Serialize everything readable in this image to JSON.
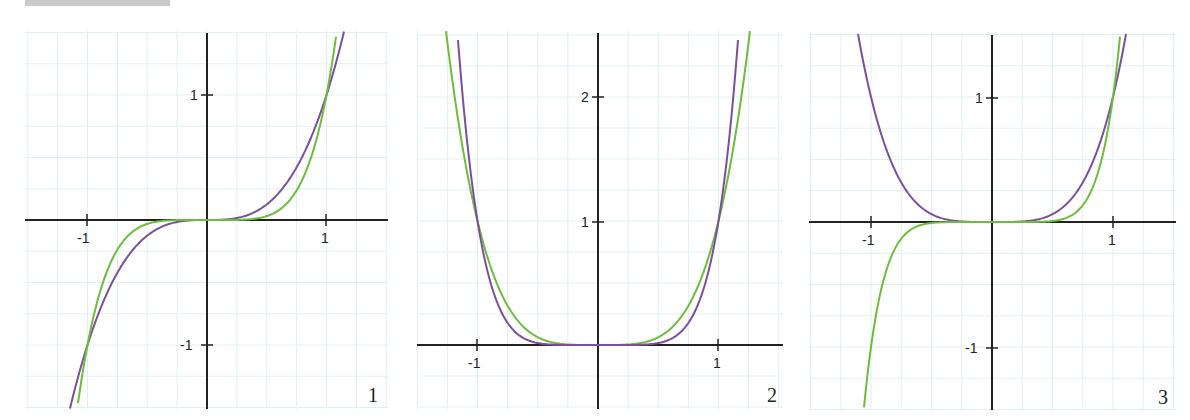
{
  "header": {
    "bar": "cropped-gray-strip"
  },
  "colors": {
    "purple": "#7b4f9e",
    "green": "#6cbd3c",
    "grid": "#dff1ee",
    "axis": "#222222"
  },
  "chart_data": [
    {
      "type": "line",
      "panel_label": "1",
      "title": "",
      "xlim": [
        -1.5,
        1.5
      ],
      "ylim": [
        -1.5,
        1.5
      ],
      "x_ticks": [
        -1,
        1
      ],
      "x_tick_labels": [
        "-1",
        "1"
      ],
      "y_ticks": [
        -1,
        1
      ],
      "y_tick_labels": [
        "-1",
        "1"
      ],
      "grid": true,
      "series": [
        {
          "name": "y = x^3",
          "color": "purple",
          "x": [
            -1.15,
            -1,
            -0.75,
            -0.5,
            -0.25,
            0,
            0.25,
            0.5,
            0.75,
            1,
            1.145
          ],
          "values": [
            -1.52,
            -1,
            -0.42,
            -0.125,
            -0.016,
            0,
            0.016,
            0.125,
            0.42,
            1,
            1.5
          ]
        },
        {
          "name": "y = x^5",
          "color": "green",
          "x": [
            -1.085,
            -1,
            -0.75,
            -0.5,
            -0.25,
            0,
            0.25,
            0.5,
            0.75,
            1,
            1.084
          ],
          "values": [
            -1.5,
            -1,
            -0.24,
            -0.031,
            -0.001,
            0,
            0.001,
            0.031,
            0.24,
            1,
            1.5
          ]
        }
      ]
    },
    {
      "type": "line",
      "panel_label": "2",
      "title": "",
      "xlim": [
        -1.5,
        1.5
      ],
      "ylim": [
        -0.5,
        2.5
      ],
      "x_ticks": [
        -1,
        1
      ],
      "x_tick_labels": [
        "-1",
        "1"
      ],
      "y_ticks": [
        1,
        2
      ],
      "y_tick_labels": [
        "1",
        "2"
      ],
      "grid": true,
      "series": [
        {
          "name": "y = x^4",
          "color": "green",
          "x": [
            -1.26,
            -1,
            -0.75,
            -0.5,
            -0.25,
            0,
            0.25,
            0.5,
            0.75,
            1,
            1.26
          ],
          "values": [
            2.52,
            1,
            0.32,
            0.063,
            0.004,
            0,
            0.004,
            0.063,
            0.32,
            1,
            2.52
          ]
        },
        {
          "name": "y = x^6",
          "color": "purple",
          "x": [
            -1.166,
            -1,
            -0.75,
            -0.5,
            -0.25,
            0,
            0.25,
            0.5,
            0.75,
            1,
            1.166
          ],
          "values": [
            2.52,
            1,
            0.18,
            0.016,
            0.0,
            0,
            0.0,
            0.016,
            0.18,
            1,
            2.52
          ]
        }
      ]
    },
    {
      "type": "line",
      "panel_label": "3",
      "title": "",
      "xlim": [
        -1.5,
        1.5
      ],
      "ylim": [
        -1.5,
        1.5
      ],
      "x_ticks": [
        -1,
        1
      ],
      "x_tick_labels": [
        "-1",
        "1"
      ],
      "y_ticks": [
        -1,
        1
      ],
      "y_tick_labels": [
        "-1",
        "1"
      ],
      "grid": true,
      "series": [
        {
          "name": "y = x^4",
          "color": "purple",
          "x": [
            -1.108,
            -1,
            -0.75,
            -0.5,
            -0.25,
            0,
            0.25,
            0.5,
            0.75,
            1,
            1.108
          ],
          "values": [
            1.51,
            1,
            0.32,
            0.063,
            0.004,
            0,
            0.004,
            0.063,
            0.32,
            1,
            1.51
          ]
        },
        {
          "name": "y = x^7",
          "color": "green",
          "x": [
            -1.06,
            -1,
            -0.75,
            -0.5,
            -0.25,
            0,
            0.25,
            0.5,
            0.75,
            1,
            1.06
          ],
          "values": [
            -1.5,
            -1,
            -0.13,
            -0.008,
            0,
            0,
            0,
            0.008,
            0.13,
            1,
            1.5
          ]
        }
      ]
    }
  ],
  "panels": [
    {
      "label": "1",
      "x_labels": [
        "-1",
        "1"
      ],
      "y_labels": [
        "1",
        "-1"
      ]
    },
    {
      "label": "2",
      "x_labels": [
        "-1",
        "1"
      ],
      "y_labels": [
        "2",
        "1"
      ]
    },
    {
      "label": "3",
      "x_labels": [
        "-1",
        "1"
      ],
      "y_labels": [
        "1",
        "-1"
      ]
    }
  ]
}
